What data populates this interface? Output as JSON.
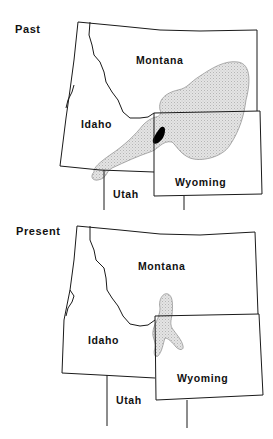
{
  "maps": [
    {
      "title": "Past",
      "labels": {
        "montana": "Montana",
        "idaho": "Idaho",
        "wyoming": "Wyoming",
        "utah": "Utah"
      },
      "range_description": "Large stippled range spanning southern Montana, northwest Wyoming and southeastern Idaho, with small solid black core area near the Idaho/Wyoming border"
    },
    {
      "title": "Present",
      "labels": {
        "montana": "Montana",
        "idaho": "Idaho",
        "wyoming": "Wyoming",
        "utah": "Utah"
      },
      "range_description": "Small stippled range near the Montana/Wyoming/Idaho junction"
    }
  ],
  "colors": {
    "border": "#1a1a1a",
    "range_fill": "#dcdcdc",
    "core_fill": "#000000"
  }
}
